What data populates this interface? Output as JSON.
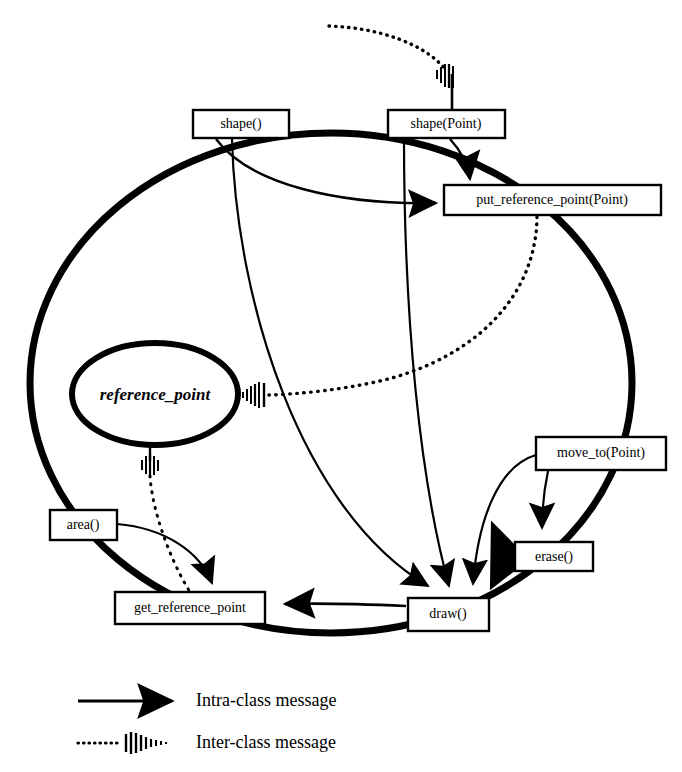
{
  "diagram": {
    "kind": "class-collaboration-diagram",
    "class_boundary": {
      "name": "class-boundary-ellipse",
      "cx": 331,
      "cy": 383,
      "rx": 301,
      "ry": 250,
      "stroke_width": 7,
      "color": "#000000"
    },
    "attributes": [
      {
        "id": "reference_point",
        "label": "reference_point",
        "shape": "ellipse",
        "cx": 155,
        "cy": 394,
        "rx": 83,
        "ry": 51,
        "stroke_width": 6
      }
    ],
    "methods": [
      {
        "id": "shape",
        "label": "shape()",
        "x": 193,
        "y": 110,
        "w": 96,
        "h": 28
      },
      {
        "id": "shape_point",
        "label": "shape(Point)",
        "x": 388,
        "y": 110,
        "w": 117,
        "h": 28
      },
      {
        "id": "put_reference_point",
        "label": "put_reference_point(Point)",
        "x": 444,
        "y": 185,
        "w": 217,
        "h": 30
      },
      {
        "id": "move_to_point",
        "label": "move_to(Point)",
        "x": 536,
        "y": 437,
        "w": 130,
        "h": 33
      },
      {
        "id": "erase",
        "label": "erase()",
        "x": 515,
        "y": 542,
        "w": 78,
        "h": 29
      },
      {
        "id": "area",
        "label": "area()",
        "x": 50,
        "y": 510,
        "w": 67,
        "h": 30
      },
      {
        "id": "get_reference_point",
        "label": "get_reference_point",
        "x": 115,
        "y": 592,
        "w": 150,
        "h": 32
      },
      {
        "id": "draw",
        "label": "draw()",
        "x": 408,
        "y": 598,
        "w": 81,
        "h": 33
      }
    ],
    "intra_class_messages": [
      {
        "from": "shape",
        "to": "put_reference_point"
      },
      {
        "from": "shape_point",
        "to": "put_reference_point"
      },
      {
        "from": "shape",
        "to": "draw"
      },
      {
        "from": "shape_point",
        "to": "draw"
      },
      {
        "from": "erase",
        "to": "draw"
      },
      {
        "from": "move_to_point",
        "to": "erase"
      },
      {
        "from": "move_to_point",
        "to": "draw"
      },
      {
        "from": "draw",
        "to": "get_reference_point"
      },
      {
        "from": "area",
        "to": "get_reference_point"
      }
    ],
    "inter_class_messages": [
      {
        "from": "external",
        "to": "shape_point"
      },
      {
        "from": "put_reference_point",
        "to": "reference_point"
      },
      {
        "from": "reference_point",
        "to": "get_reference_point"
      }
    ]
  },
  "legend": {
    "name": "legend",
    "entries": [
      {
        "id": "intra",
        "label": "Intra-class message",
        "style": "solid-arrow",
        "y": 701
      },
      {
        "id": "inter",
        "label": "Inter-class message",
        "style": "dotted-hatch",
        "y": 743
      }
    ]
  }
}
